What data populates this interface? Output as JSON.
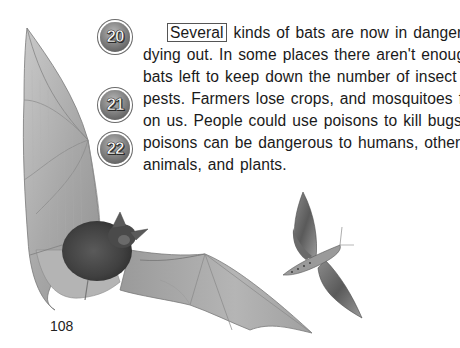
{
  "page": {
    "number": "108",
    "background": "#ffffff"
  },
  "badges": [
    {
      "label": "20",
      "x": 100,
      "y": 22
    },
    {
      "label": "21",
      "x": 100,
      "y": 90
    },
    {
      "label": "22",
      "x": 100,
      "y": 134
    }
  ],
  "passage": {
    "boxed_word": "Several",
    "lines": [
      " kinds of bats are now in danger of",
      "dying out. In some places there aren't enough",
      "bats left to keep down the number of insect",
      "pests. Farmers lose crops, and mosquitoes feast",
      "on us. People could use poisons to kill bugs, but",
      "poisons can be dangerous to humans, other",
      "animals, and plants."
    ]
  },
  "illustration": {
    "subjects": [
      "bat",
      "moth"
    ],
    "style": "grayscale pencil drawing"
  }
}
